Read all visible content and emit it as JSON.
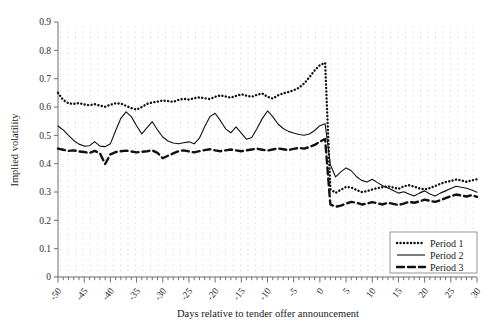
{
  "chart_data": {
    "type": "line",
    "title": "",
    "xlabel": "Days relative to tender offer announcement",
    "ylabel": "Implied volatility",
    "xlim": [
      -50,
      30
    ],
    "ylim": [
      0,
      0.9
    ],
    "grid": true,
    "legend_position": "bottom-right",
    "ytick_labels": [
      "0",
      "0.1",
      "0.2",
      "0.3",
      "0.4",
      "0.5",
      "0.6",
      "0.7",
      "0.8",
      "0.9"
    ],
    "ytick_values": [
      0,
      0.1,
      0.2,
      0.3,
      0.4,
      0.5,
      0.6,
      0.7,
      0.8,
      0.9
    ],
    "xtick_labels": [
      "-50",
      "-45",
      "-40",
      "-35",
      "-30",
      "-25",
      "-20",
      "-15",
      "-10",
      "-5",
      "0",
      "5",
      "10",
      "15",
      "20",
      "25",
      "30"
    ],
    "xtick_values": [
      -50,
      -45,
      -40,
      -35,
      -30,
      -25,
      -20,
      -15,
      -10,
      -5,
      0,
      5,
      10,
      15,
      20,
      25,
      30
    ],
    "x": [
      -50,
      -49,
      -48,
      -47,
      -46,
      -45,
      -44,
      -43,
      -42,
      -41,
      -40,
      -39,
      -38,
      -37,
      -36,
      -35,
      -34,
      -33,
      -32,
      -31,
      -30,
      -29,
      -28,
      -27,
      -26,
      -25,
      -24,
      -23,
      -22,
      -21,
      -20,
      -19,
      -18,
      -17,
      -16,
      -15,
      -14,
      -13,
      -12,
      -11,
      -10,
      -9,
      -8,
      -7,
      -6,
      -5,
      -4,
      -3,
      -2,
      -1,
      0,
      1,
      2,
      3,
      4,
      5,
      6,
      7,
      8,
      9,
      10,
      11,
      12,
      13,
      14,
      15,
      16,
      17,
      18,
      19,
      20,
      21,
      22,
      23,
      24,
      25,
      26,
      27,
      28,
      29,
      30
    ],
    "series": [
      {
        "name": "Period 1",
        "style": "dotted",
        "color": "#111111",
        "values": [
          0.65,
          0.625,
          0.613,
          0.611,
          0.614,
          0.609,
          0.606,
          0.61,
          0.605,
          0.601,
          0.608,
          0.613,
          0.612,
          0.604,
          0.596,
          0.591,
          0.6,
          0.611,
          0.616,
          0.619,
          0.623,
          0.621,
          0.618,
          0.625,
          0.629,
          0.626,
          0.631,
          0.634,
          0.631,
          0.628,
          0.636,
          0.641,
          0.637,
          0.633,
          0.639,
          0.645,
          0.64,
          0.636,
          0.643,
          0.648,
          0.636,
          0.63,
          0.641,
          0.648,
          0.653,
          0.659,
          0.668,
          0.683,
          0.705,
          0.729,
          0.748,
          0.756,
          0.31,
          0.297,
          0.308,
          0.318,
          0.316,
          0.307,
          0.3,
          0.303,
          0.309,
          0.314,
          0.317,
          0.32,
          0.316,
          0.311,
          0.32,
          0.324,
          0.319,
          0.313,
          0.309,
          0.314,
          0.321,
          0.329,
          0.335,
          0.339,
          0.344,
          0.341,
          0.336,
          0.341,
          0.345
        ]
      },
      {
        "name": "Period 2",
        "style": "solid",
        "color": "#111111",
        "values": [
          0.533,
          0.519,
          0.5,
          0.482,
          0.469,
          0.462,
          0.463,
          0.478,
          0.462,
          0.46,
          0.47,
          0.516,
          0.56,
          0.583,
          0.566,
          0.534,
          0.505,
          0.527,
          0.548,
          0.519,
          0.494,
          0.48,
          0.473,
          0.47,
          0.474,
          0.477,
          0.47,
          0.49,
          0.53,
          0.566,
          0.578,
          0.552,
          0.523,
          0.509,
          0.53,
          0.508,
          0.486,
          0.492,
          0.524,
          0.559,
          0.586,
          0.566,
          0.54,
          0.524,
          0.514,
          0.508,
          0.503,
          0.5,
          0.505,
          0.517,
          0.534,
          0.541,
          0.396,
          0.353,
          0.371,
          0.385,
          0.375,
          0.354,
          0.341,
          0.335,
          0.345,
          0.333,
          0.322,
          0.314,
          0.305,
          0.296,
          0.301,
          0.293,
          0.286,
          0.296,
          0.304,
          0.293,
          0.286,
          0.296,
          0.304,
          0.312,
          0.32,
          0.317,
          0.313,
          0.307,
          0.299
        ]
      },
      {
        "name": "Period 3",
        "style": "dashed",
        "color": "#111111",
        "values": [
          0.453,
          0.449,
          0.445,
          0.447,
          0.443,
          0.441,
          0.438,
          0.445,
          0.437,
          0.399,
          0.433,
          0.441,
          0.444,
          0.446,
          0.443,
          0.44,
          0.442,
          0.444,
          0.447,
          0.438,
          0.419,
          0.428,
          0.436,
          0.444,
          0.447,
          0.443,
          0.44,
          0.444,
          0.448,
          0.451,
          0.447,
          0.444,
          0.447,
          0.45,
          0.447,
          0.444,
          0.447,
          0.45,
          0.453,
          0.449,
          0.446,
          0.45,
          0.454,
          0.451,
          0.448,
          0.452,
          0.456,
          0.453,
          0.459,
          0.466,
          0.478,
          0.487,
          0.256,
          0.248,
          0.252,
          0.259,
          0.265,
          0.262,
          0.256,
          0.259,
          0.264,
          0.26,
          0.256,
          0.262,
          0.258,
          0.254,
          0.259,
          0.265,
          0.262,
          0.267,
          0.273,
          0.269,
          0.265,
          0.271,
          0.278,
          0.285,
          0.291,
          0.288,
          0.284,
          0.289,
          0.283
        ]
      }
    ],
    "legend": [
      {
        "label": "Period 1",
        "style": "dotted"
      },
      {
        "label": "Period 2",
        "style": "solid"
      },
      {
        "label": "Period 3",
        "style": "dashed"
      }
    ]
  }
}
